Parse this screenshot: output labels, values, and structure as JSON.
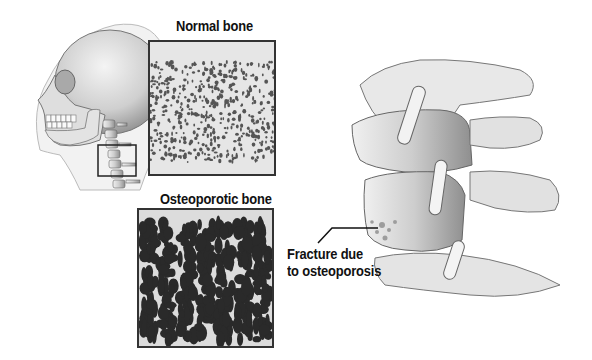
{
  "figure": {
    "labels": {
      "normal_bone": "Normal bone",
      "osteoporotic_bone": "Osteoporotic bone",
      "fracture_line1": "Fracture due",
      "fracture_line2": "to osteoporosis"
    },
    "panels": [
      {
        "id": "skull",
        "description": "Side view of human skull and cervical spine inside head outline, with small square highlighting the cervical vertebrae"
      },
      {
        "id": "normal-bone",
        "description": "Dense trabecular bone texture with small evenly distributed pores"
      },
      {
        "id": "osteoporotic-bone",
        "description": "Sparse bone texture with large dark vertical voids"
      },
      {
        "id": "vertebrae",
        "description": "Close-up of stacked cervical vertebrae showing a compression fracture"
      }
    ],
    "colors": {
      "ink": "#111111",
      "box_border": "#333333",
      "bone_light": "#e6e6e6",
      "bone_shade": "#9a9a9a",
      "void_dark": "#2a2a2a"
    }
  }
}
